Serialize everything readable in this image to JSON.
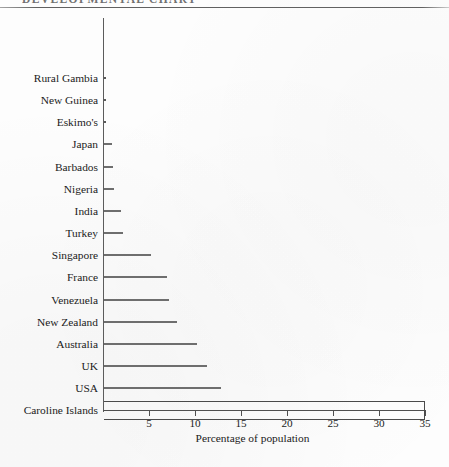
{
  "page": {
    "running_title": "DEVELOPMENTAL CHART",
    "x_axis_title": "Percentage of population"
  },
  "chart_data": {
    "type": "bar",
    "orientation": "horizontal",
    "title": "",
    "xlabel": "Percentage of population",
    "ylabel": "",
    "xlim": [
      0,
      35
    ],
    "xticks": [
      5,
      10,
      15,
      20,
      25,
      30,
      35
    ],
    "xtick_labels": [
      "5",
      "10",
      "15",
      "20",
      "25",
      "30",
      "35"
    ],
    "grid": false,
    "legend": false,
    "categories": [
      "Rural Gambia",
      "New Guinea",
      "Eskimo's",
      "Japan",
      "Barbados",
      "Nigeria",
      "India",
      "Turkey",
      "Singapore",
      "France",
      "Venezuela",
      "New Zealand",
      "Australia",
      "UK",
      "USA",
      "Caroline Islands"
    ],
    "values": [
      0,
      0.1,
      0.3,
      1.0,
      1.1,
      1.2,
      2.0,
      2.2,
      5.2,
      7.0,
      7.2,
      8.0,
      10.2,
      11.3,
      12.8,
      35.0
    ],
    "bar_style": [
      "line",
      "line",
      "line",
      "line",
      "line",
      "line",
      "line",
      "line",
      "line",
      "line",
      "line",
      "line",
      "line",
      "line",
      "line",
      "box"
    ],
    "colors": {
      "bar": "#6e6e6e",
      "box_outline": "#4a4a4a",
      "axis": "#4f4f4f",
      "text": "#1b1b1b",
      "background": "#fdfdfd"
    }
  }
}
